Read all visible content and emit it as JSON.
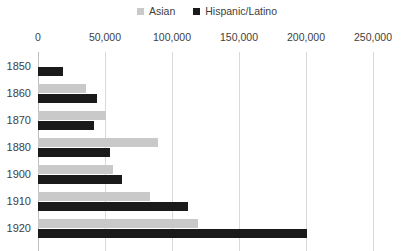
{
  "legend": {
    "position": "top-center",
    "entries": [
      {
        "label": "Asian",
        "color": "#c9c9c9",
        "swatch_name": "legend-swatch-asian"
      },
      {
        "label": "Hispanic/Latino",
        "color": "#1a1a1a",
        "swatch_name": "legend-swatch-hispanic-latino"
      }
    ]
  },
  "axis": {
    "x_ticks": [
      "0",
      "50,000",
      "100,000",
      "150,000",
      "200,000",
      "250,000"
    ],
    "x_tick_values": [
      0,
      50000,
      100000,
      150000,
      200000,
      250000
    ]
  },
  "colors": {
    "asian": "#c9c9c9",
    "hispanic": "#1a1a1a",
    "gridline": "#d9d9d9",
    "axis": "#bfbfbf",
    "text": "#3d3d3d",
    "background": "#ffffff"
  },
  "chart_data": {
    "type": "bar",
    "orientation": "horizontal",
    "title": "",
    "xlabel": "",
    "ylabel": "",
    "xlim": [
      0,
      250000
    ],
    "grid": true,
    "legend_position": "top-center",
    "categories": [
      "1850",
      "1860",
      "1870",
      "1880",
      "1900",
      "1910",
      "1920"
    ],
    "series": [
      {
        "name": "Asian",
        "color": "#c9c9c9",
        "values": [
          0,
          36000,
          51000,
          89500,
          56000,
          83500,
          119500
        ]
      },
      {
        "name": "Hispanic/Latino",
        "color": "#1a1a1a",
        "values": [
          18500,
          44000,
          41500,
          53500,
          63000,
          112000,
          201000
        ]
      }
    ]
  }
}
